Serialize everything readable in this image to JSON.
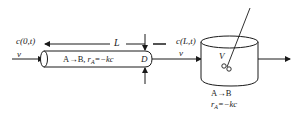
{
  "diagram": {
    "colors": {
      "stroke": "#1a1a1a",
      "background": "#ffffff"
    },
    "pfr": {
      "inlet_concentration": "c(0,t)",
      "inlet_velocity": "v",
      "length_label": "L",
      "diameter_label": "D",
      "reaction": "A→B, ",
      "rate_symbol": "r",
      "rate_subscript": "A",
      "rate_expression": "=−kc"
    },
    "cstr": {
      "inlet_concentration": "c(L,t)",
      "inlet_velocity": "v",
      "volume_label": "V",
      "reaction": "A→B",
      "rate_symbol": "r",
      "rate_subscript": "A",
      "rate_expression": "=−kc"
    }
  }
}
